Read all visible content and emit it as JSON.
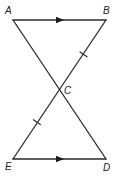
{
  "figure": {
    "type": "geometry",
    "colors": {
      "line": "#2a2a2a",
      "label": "#222222",
      "background": "#ffffff"
    },
    "points": {
      "A": {
        "label": "A",
        "x": 13,
        "y": 20
      },
      "B": {
        "label": "B",
        "x": 106,
        "y": 20
      },
      "C": {
        "label": "C",
        "x": 59.5,
        "y": 89.5
      },
      "D": {
        "label": "D",
        "x": 106,
        "y": 159
      },
      "E": {
        "label": "E",
        "x": 13,
        "y": 159
      }
    },
    "segments": [
      {
        "from": "A",
        "to": "B",
        "marker": "parallel-arrow"
      },
      {
        "from": "A",
        "to": "D",
        "marker": "none"
      },
      {
        "from": "B",
        "to": "E",
        "marker": "none"
      },
      {
        "from": "E",
        "to": "D",
        "marker": "parallel-arrow"
      },
      {
        "from": "B",
        "to": "C",
        "marker": "congruence-tick"
      },
      {
        "from": "C",
        "to": "E",
        "marker": "congruence-tick"
      }
    ],
    "markings": {
      "parallel": [
        "AB",
        "ED"
      ],
      "congruent": [
        "BC",
        "CE"
      ]
    }
  }
}
